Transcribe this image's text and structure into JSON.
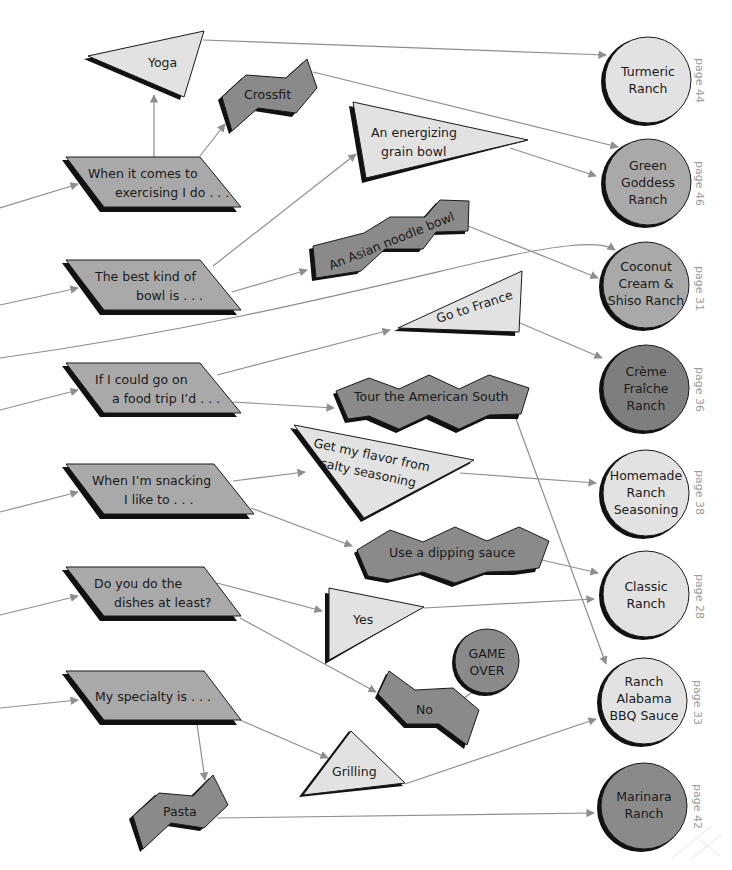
{
  "colors": {
    "light": "#e2e2e2",
    "mid": "#a9a9a9",
    "dark": "#8a8a8a",
    "darker": "#7e7e7e",
    "edge": "#8e8e8e",
    "page_text": "#9a9a9a"
  },
  "questions": [
    {
      "id": "q1",
      "lines": [
        "When it comes to",
        "exercising I do . . ."
      ]
    },
    {
      "id": "q2",
      "lines": [
        "The best kind of",
        "bowl is . . ."
      ]
    },
    {
      "id": "q3",
      "lines": [
        "If I could go on",
        "a food trip I’d . . ."
      ]
    },
    {
      "id": "q4",
      "lines": [
        "When I’m snacking",
        "I like to . . ."
      ]
    },
    {
      "id": "q5",
      "lines": [
        "Do you do the",
        "dishes at least?"
      ]
    },
    {
      "id": "q6",
      "lines": [
        "My specialty is . . ."
      ]
    }
  ],
  "answers": {
    "yoga": "Yoga",
    "crossfit": "Crossfit",
    "grain_bowl": [
      "An energizing",
      "grain bowl"
    ],
    "noodle_bowl": "An Asian noodle bowl",
    "france": "Go to France",
    "south": "Tour the American South",
    "salty": [
      "Get my flavor from",
      "salty seasoning"
    ],
    "dipping": "Use a dipping sauce",
    "yes": "Yes",
    "no": "No",
    "grilling": "Grilling",
    "pasta": "Pasta",
    "game_over": [
      "GAME",
      "OVER"
    ]
  },
  "results": [
    {
      "id": "turmeric",
      "lines": [
        "Turmeric",
        "Ranch"
      ],
      "page": "page 44",
      "shade": "light"
    },
    {
      "id": "green_goddess",
      "lines": [
        "Green",
        "Goddess",
        "Ranch"
      ],
      "page": "page 46",
      "shade": "mid"
    },
    {
      "id": "coconut",
      "lines": [
        "Coconut",
        "Cream &",
        "Shiso Ranch"
      ],
      "page": "page 31",
      "shade": "mid"
    },
    {
      "id": "creme",
      "lines": [
        "Crème",
        "Fraîche",
        "Ranch"
      ],
      "page": "page 36",
      "shade": "darker"
    },
    {
      "id": "homemade",
      "lines": [
        "Homemade",
        "Ranch",
        "Seasoning"
      ],
      "page": "page 38",
      "shade": "light"
    },
    {
      "id": "classic",
      "lines": [
        "Classic",
        "Ranch"
      ],
      "page": "page 28",
      "shade": "light"
    },
    {
      "id": "alabama",
      "lines": [
        "Ranch",
        "Alabama",
        "BBQ Sauce"
      ],
      "page": "page 33",
      "shade": "light"
    },
    {
      "id": "marinara",
      "lines": [
        "Marinara",
        "Ranch"
      ],
      "page": "page 42",
      "shade": "dark"
    }
  ]
}
